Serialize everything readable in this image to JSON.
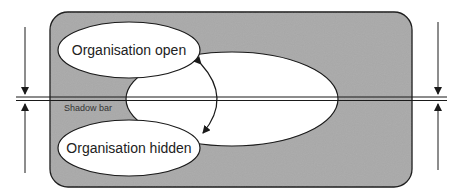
{
  "diagram": {
    "panel_color": "#a9a9a9",
    "stroke_color": "#1a1a1a",
    "ellipse_fill": "#ffffff",
    "labels": {
      "top_ellipse": "Organisation open",
      "bottom_ellipse": "Organisation hidden",
      "shadow_bar": "Shadow bar"
    }
  }
}
